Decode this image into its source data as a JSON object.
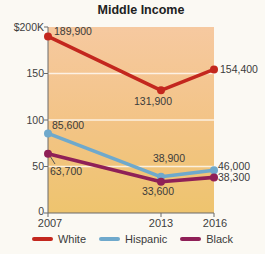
{
  "title": "Middle Income",
  "chart_data": {
    "type": "line",
    "title": "Middle Income",
    "x": [
      2007,
      2013,
      2016
    ],
    "x_tick_labels": [
      "2007",
      "2013",
      "2016"
    ],
    "y_axis": {
      "tick_labels": [
        "$200K",
        "150",
        "100",
        "50",
        "0"
      ],
      "tick_values": [
        200000,
        150000,
        100000,
        50000,
        0
      ],
      "ylim": [
        0,
        200000
      ],
      "unit": "USD (thousands shown)"
    },
    "series": [
      {
        "name": "White",
        "color": "#c3271e",
        "values": [
          189900,
          131900,
          154400
        ],
        "labels": [
          "189,900",
          "131,900",
          "154,400"
        ]
      },
      {
        "name": "Hispanic",
        "color": "#6fa9cc",
        "values": [
          85600,
          38900,
          46000
        ],
        "labels": [
          "85,600",
          "38,900",
          "46,000"
        ]
      },
      {
        "name": "Black",
        "color": "#8f2057",
        "values": [
          63700,
          33600,
          38300
        ],
        "labels": [
          "63,700",
          "33,600",
          "38,300"
        ]
      }
    ],
    "legend": {
      "position": "bottom",
      "entries": [
        "White",
        "Hispanic",
        "Black"
      ]
    },
    "grid": "horizontal-white-lines",
    "plot_background": {
      "top_color": "#f6c9a0",
      "mid_color": "#f3c487",
      "bottom_color": "#eec46e"
    }
  }
}
